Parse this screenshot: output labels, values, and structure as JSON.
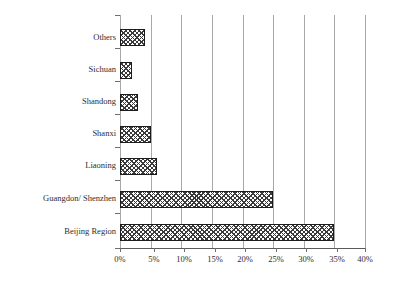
{
  "chart_data": {
    "type": "bar",
    "orientation": "horizontal",
    "title": "",
    "subtitle": "",
    "xlabel": "",
    "ylabel": "",
    "categories": [
      "Others",
      "Sichuan",
      "Shandong",
      "Shanxi",
      "Liaoning",
      "Guangdon/ Shenzhen",
      "Beijing Region"
    ],
    "values": [
      4,
      2,
      3,
      5,
      6,
      25,
      35
    ],
    "value_unit": "%",
    "xlim": [
      0,
      40
    ],
    "xticks": [
      0,
      5,
      10,
      15,
      20,
      25,
      30,
      35,
      40
    ],
    "xtick_labels": [
      "0%",
      "5%",
      "10%",
      "15%",
      "20%",
      "25%",
      "30%",
      "35%",
      "40%"
    ],
    "grid": "vertical",
    "legend": "none",
    "bar_fill": "checkerboard-hatch",
    "bar_outline_color": "#1c1c1c",
    "gridline_color": "#a8a8a8",
    "axis_color": "#5a5a5a",
    "text_color": "#2e2e2e",
    "background": "#ffffff"
  }
}
